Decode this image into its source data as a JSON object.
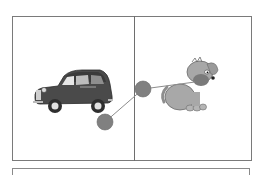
{
  "worksheet": {
    "panels": [
      {
        "id": "left",
        "picture": "car",
        "icon": "car-icon"
      },
      {
        "id": "right",
        "picture": "dog",
        "icon": "dog-icon"
      }
    ],
    "connector": {
      "dots": [
        {
          "cx": 105,
          "cy": 122,
          "r": 8
        },
        {
          "cx": 143,
          "cy": 89,
          "r": 8
        }
      ],
      "end_point": {
        "x": 195,
        "y": 82
      }
    },
    "colors": {
      "border": "#7a7a7a",
      "dot": "#808080",
      "line": "#8c8c8c",
      "car_body": "#4a4a4a",
      "dog_body": "#a8a8a8"
    },
    "answer_box_text": ""
  }
}
